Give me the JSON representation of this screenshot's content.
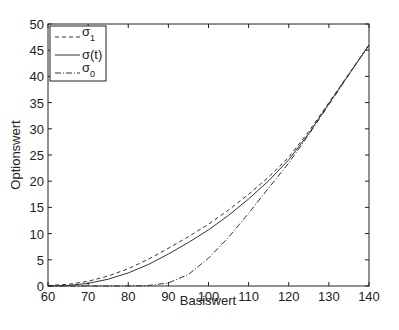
{
  "chart_data": {
    "type": "line",
    "title": "",
    "xlabel": "Basiswert",
    "ylabel": "Optionswert",
    "xlim": [
      60,
      140
    ],
    "ylim": [
      0,
      50
    ],
    "xticks": [
      60,
      70,
      80,
      90,
      100,
      110,
      120,
      130,
      140
    ],
    "yticks": [
      0,
      5,
      10,
      15,
      20,
      25,
      30,
      35,
      40,
      45,
      50
    ],
    "grid": false,
    "legend_position": "upper left",
    "x": [
      60,
      65,
      70,
      75,
      80,
      85,
      90,
      95,
      100,
      105,
      110,
      115,
      120,
      125,
      130,
      135,
      140
    ],
    "series": [
      {
        "name": "σ1",
        "style": "dashed",
        "values": [
          0.1,
          0.3,
          0.9,
          1.9,
          3.3,
          5.1,
          7.2,
          9.4,
          11.8,
          14.5,
          17.5,
          20.8,
          24.6,
          29.5,
          35.0,
          40.5,
          46.0
        ]
      },
      {
        "name": "σ(t)",
        "style": "solid",
        "values": [
          0.0,
          0.1,
          0.5,
          1.3,
          2.5,
          4.1,
          6.1,
          8.3,
          10.7,
          13.5,
          16.6,
          20.1,
          24.1,
          29.1,
          34.8,
          40.4,
          46.0
        ]
      },
      {
        "name": "σ0",
        "style": "dashdot",
        "values": [
          0.0,
          0.0,
          0.0,
          0.0,
          0.0,
          0.1,
          0.6,
          2.2,
          5.3,
          9.3,
          13.9,
          18.7,
          23.5,
          28.9,
          34.6,
          40.3,
          46.0
        ]
      }
    ]
  }
}
